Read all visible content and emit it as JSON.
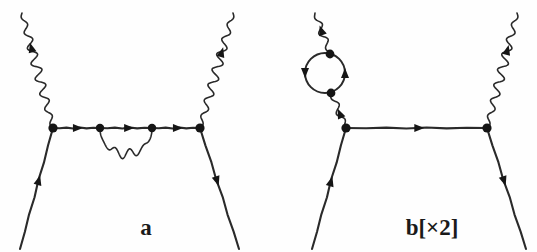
{
  "figure": {
    "background_color": "#fefefe",
    "ink_color": "#2a2a2a",
    "width": 537,
    "height": 252,
    "type": "feynman-diagram-pair"
  },
  "diagrams": [
    {
      "id": "a",
      "label": "a",
      "label_x": 146,
      "label_y": 235,
      "vertices": [
        {
          "name": "left-vertex",
          "x": 53,
          "y": 128,
          "r": 4.6
        },
        {
          "name": "inner-left-vertex",
          "x": 100,
          "y": 128,
          "r": 4.2
        },
        {
          "name": "inner-right-vertex",
          "x": 152,
          "y": 128,
          "r": 4.2
        },
        {
          "name": "right-vertex",
          "x": 200,
          "y": 128,
          "r": 4.6
        }
      ],
      "fermion_segments": [
        {
          "name": "incoming-electron-lower-left",
          "x1": 20,
          "y1": 249,
          "x2": 53,
          "y2": 128,
          "arrow_t": 0.57,
          "arrow_dir": "forward"
        },
        {
          "name": "internal-fermion-left",
          "x1": 53,
          "y1": 128,
          "x2": 100,
          "y2": 128,
          "arrow_t": 0.53,
          "arrow_dir": "forward"
        },
        {
          "name": "internal-fermion-middle",
          "x1": 100,
          "y1": 128,
          "x2": 152,
          "y2": 128,
          "arrow_t": 0.56,
          "arrow_dir": "forward"
        },
        {
          "name": "internal-fermion-right",
          "x1": 152,
          "y1": 128,
          "x2": 200,
          "y2": 128,
          "arrow_t": 0.54,
          "arrow_dir": "forward"
        },
        {
          "name": "outgoing-electron-lower-right",
          "x1": 200,
          "y1": 128,
          "x2": 239,
          "y2": 249,
          "arrow_t": 0.44,
          "arrow_dir": "forward"
        }
      ],
      "photon_legs": [
        {
          "name": "incoming-photon-upper-left",
          "x1": 22,
          "y1": 13,
          "x2": 53,
          "y2": 128,
          "amplitude": 4.6,
          "waves": 7.5,
          "arrow_t": 0.3,
          "arrow_dir": "backward"
        },
        {
          "name": "outgoing-photon-upper-right",
          "x1": 200,
          "y1": 128,
          "x2": 233,
          "y2": 13,
          "amplitude": 4.6,
          "waves": 7.5,
          "arrow_t": 0.66,
          "arrow_dir": "forward"
        }
      ],
      "photon_loops": [
        {
          "name": "virtual-photon-arc",
          "x1": 100,
          "y1": 128,
          "x2": 152,
          "y2": 128,
          "depth": 26,
          "waves": 3.5,
          "amplitude": 5.0
        }
      ],
      "fermion_loops": []
    },
    {
      "id": "b",
      "label": "b[×2]",
      "label_x": 432,
      "label_y": 235,
      "vertices": [
        {
          "name": "left-vertex",
          "x": 346,
          "y": 128,
          "r": 4.6
        },
        {
          "name": "right-vertex",
          "x": 487,
          "y": 128,
          "r": 4.6
        },
        {
          "name": "loop-top-vertex",
          "x": 330,
          "y": 54,
          "r": 4.4
        },
        {
          "name": "loop-bottom-vertex",
          "x": 331,
          "y": 93,
          "r": 4.4
        }
      ],
      "fermion_segments": [
        {
          "name": "incoming-electron-lower-left",
          "x1": 312,
          "y1": 249,
          "x2": 346,
          "y2": 128,
          "arrow_t": 0.56,
          "arrow_dir": "forward"
        },
        {
          "name": "internal-fermion",
          "x1": 346,
          "y1": 128,
          "x2": 487,
          "y2": 128,
          "arrow_t": 0.52,
          "arrow_dir": "forward"
        },
        {
          "name": "outgoing-electron-lower-right",
          "x1": 487,
          "y1": 128,
          "x2": 526,
          "y2": 249,
          "arrow_t": 0.44,
          "arrow_dir": "forward"
        }
      ],
      "photon_legs": [
        {
          "name": "incoming-photon-upper-left",
          "x1": 315,
          "y1": 13,
          "x2": 330,
          "y2": 54,
          "amplitude": 3.6,
          "waves": 2.6,
          "arrow_t": 0.42,
          "arrow_dir": "backward"
        },
        {
          "name": "outgoing-photon-upper-right",
          "x1": 487,
          "y1": 128,
          "x2": 517,
          "y2": 13,
          "amplitude": 4.6,
          "waves": 7.5,
          "arrow_t": 0.68,
          "arrow_dir": "forward"
        }
      ],
      "photon_loops": [
        {
          "name": "photon-stub-to-vertex",
          "x1": 331,
          "y1": 93,
          "x2": 346,
          "y2": 128,
          "depth": 0,
          "waves": 2.2,
          "amplitude": 3.4,
          "straightish": true,
          "arrow_t": 0.58,
          "arrow_dir": "backward"
        }
      ],
      "fermion_loops": [
        {
          "name": "vacuum-polarization-bubble",
          "cx": 325,
          "cy": 73,
          "r": 20,
          "arrows": [
            {
              "angle_deg": 180,
              "dir": "down"
            },
            {
              "angle_deg": 0,
              "dir": "up"
            }
          ]
        }
      ]
    }
  ],
  "arrow_style": {
    "length": 10,
    "width": 8
  }
}
